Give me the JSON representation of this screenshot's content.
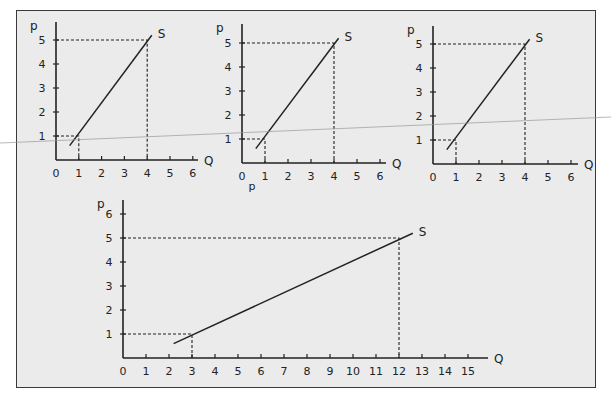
{
  "figure": {
    "background": "#ebebeb",
    "border_color": "#3a3a3a",
    "line_color": "#222222",
    "stray_label": "p"
  },
  "chart_data": [
    {
      "type": "line",
      "id": "panel-1",
      "title": "",
      "xlabel": "Q",
      "ylabel": "p",
      "x_ticks": [
        "0",
        "1",
        "2",
        "3",
        "4",
        "5",
        "6"
      ],
      "y_ticks": [
        "1",
        "2",
        "3",
        "4",
        "5"
      ],
      "xlim": [
        0,
        6
      ],
      "ylim": [
        0,
        5
      ],
      "series": [
        {
          "name": "S",
          "points": [
            [
              0.6,
              0.6
            ],
            [
              4.2,
              5.2
            ]
          ]
        }
      ],
      "reference_points": [
        {
          "q": 1,
          "p": 1
        },
        {
          "q": 4,
          "p": 5
        }
      ],
      "grid": false
    },
    {
      "type": "line",
      "id": "panel-2",
      "title": "",
      "xlabel": "Q",
      "ylabel": "p",
      "x_ticks": [
        "0",
        "1",
        "2",
        "3",
        "4",
        "5",
        "6"
      ],
      "y_ticks": [
        "1",
        "2",
        "3",
        "4",
        "5"
      ],
      "xlim": [
        0,
        6
      ],
      "ylim": [
        0,
        5
      ],
      "series": [
        {
          "name": "S",
          "points": [
            [
              0.6,
              0.6
            ],
            [
              4.2,
              5.2
            ]
          ]
        }
      ],
      "reference_points": [
        {
          "q": 1,
          "p": 1
        },
        {
          "q": 4,
          "p": 5
        }
      ],
      "grid": false
    },
    {
      "type": "line",
      "id": "panel-3",
      "title": "",
      "xlabel": "Q",
      "ylabel": "p",
      "x_ticks": [
        "0",
        "1",
        "2",
        "3",
        "4",
        "5",
        "6"
      ],
      "y_ticks": [
        "1",
        "2",
        "3",
        "4",
        "5"
      ],
      "xlim": [
        0,
        6
      ],
      "ylim": [
        0,
        5
      ],
      "series": [
        {
          "name": "S",
          "points": [
            [
              0.6,
              0.6
            ],
            [
              4.2,
              5.2
            ]
          ]
        }
      ],
      "reference_points": [
        {
          "q": 1,
          "p": 1
        },
        {
          "q": 4,
          "p": 5
        }
      ],
      "grid": false
    },
    {
      "type": "line",
      "id": "panel-4",
      "title": "",
      "xlabel": "Q",
      "ylabel": "p",
      "x_ticks": [
        "0",
        "1",
        "2",
        "3",
        "4",
        "5",
        "6",
        "7",
        "8",
        "9",
        "10",
        "11",
        "12",
        "13",
        "14",
        "15"
      ],
      "y_ticks": [
        "1",
        "2",
        "3",
        "4",
        "5",
        "6"
      ],
      "xlim": [
        0,
        15
      ],
      "ylim": [
        0,
        6
      ],
      "series": [
        {
          "name": "S",
          "points": [
            [
              2.2,
              0.6
            ],
            [
              12.6,
              5.2
            ]
          ]
        }
      ],
      "reference_points": [
        {
          "q": 3,
          "p": 1
        },
        {
          "q": 12,
          "p": 5
        }
      ],
      "grid": false
    }
  ]
}
